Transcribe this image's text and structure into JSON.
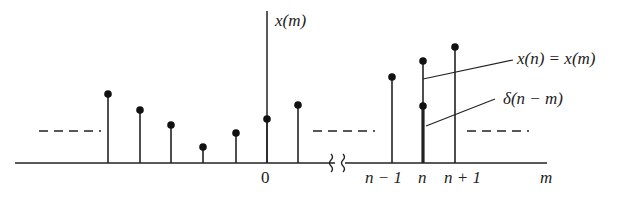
{
  "diagram": {
    "axis": {
      "x_label": "m",
      "y_label": "x(m)",
      "origin_label": "0",
      "ticks": [
        "n − 1",
        "n",
        "n + 1"
      ],
      "break_symbol": "≀ ≀"
    },
    "annotations": {
      "x_equals": "x(n) = x(m)",
      "delta": "δ(n − m)"
    },
    "colors": {
      "ink": "#222222",
      "background": "#ffffff"
    },
    "stems_left": [
      {
        "x": 108,
        "top": 94
      },
      {
        "x": 140,
        "top": 110
      },
      {
        "x": 171,
        "top": 125
      },
      {
        "x": 203,
        "top": 147
      },
      {
        "x": 236,
        "top": 133
      },
      {
        "x": 267,
        "top": 119
      },
      {
        "x": 298,
        "top": 105
      }
    ],
    "stems_right": [
      {
        "x": 392,
        "top": 77,
        "label": "n − 1"
      },
      {
        "x": 423,
        "top": 61,
        "label": "n"
      },
      {
        "x": 455,
        "top": 47,
        "label": "n + 1"
      }
    ],
    "delta_stem": {
      "x": 423,
      "top": 106
    }
  }
}
